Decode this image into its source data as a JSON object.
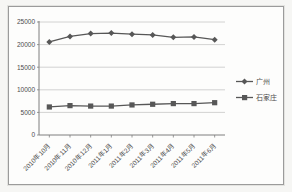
{
  "chart_data": {
    "type": "line",
    "title": "",
    "xlabel": "",
    "ylabel": "",
    "categories": [
      "2010年10月",
      "2010年11月",
      "2010年12月",
      "2011年1月",
      "2011年2月",
      "2011年3月",
      "2011年4月",
      "2011年5月",
      "2011年6月"
    ],
    "series": [
      {
        "name": "广州",
        "marker": "diamond",
        "values": [
          20600,
          21800,
          22450,
          22550,
          22300,
          22150,
          21600,
          21700,
          21100
        ]
      },
      {
        "name": "石家庄",
        "marker": "square",
        "values": [
          6200,
          6500,
          6400,
          6400,
          6650,
          6800,
          6950,
          6950,
          7150
        ]
      }
    ],
    "ylim": [
      0,
      25000
    ],
    "ytick_step": 5000,
    "yticks": [
      "0",
      "5000",
      "10000",
      "15000",
      "20000",
      "25000"
    ],
    "grid": true,
    "legend_position": "right",
    "colors": {
      "line": "#575757",
      "marker": "#575757",
      "grid": "#c6c6c6",
      "axis": "#7f7f7f",
      "text": "#4c4c4c",
      "plot_background": "#fdfdfc",
      "frame_border": "#9b9b9b"
    }
  }
}
